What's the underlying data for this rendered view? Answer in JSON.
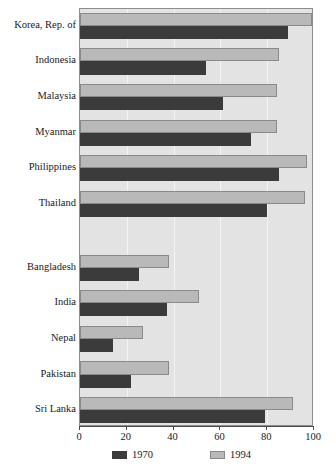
{
  "chart_data": {
    "type": "bar",
    "orientation": "horizontal",
    "title": "",
    "xlabel": "",
    "ylabel": "",
    "xlim": [
      0,
      100
    ],
    "xticks": [
      0,
      20,
      40,
      60,
      80,
      100
    ],
    "xtick_labels": [
      "0",
      "20",
      "40",
      "60",
      "80",
      "100"
    ],
    "grid": true,
    "legend_position": "bottom",
    "categories": [
      "Korea, Rep. of",
      "Indonesia",
      "Malaysia",
      "Myanmar",
      "Philippines",
      "Thailand",
      "Bangladesh",
      "India",
      "Nepal",
      "Pakistan",
      "Sri Lanka"
    ],
    "group_breaks": [
      6
    ],
    "series": [
      {
        "name": "1970",
        "color": "#3b3b3b",
        "values": [
          89,
          54,
          61,
          73,
          85,
          80,
          25,
          37,
          14,
          22,
          79
        ]
      },
      {
        "name": "1994",
        "color": "#b9b9b9",
        "values": [
          99,
          85,
          84,
          84,
          97,
          96,
          38,
          51,
          27,
          38,
          91
        ]
      }
    ]
  },
  "legend": {
    "entries": [
      {
        "label": "1970",
        "swatch": "s1970"
      },
      {
        "label": "1994",
        "swatch": "s1994"
      }
    ]
  },
  "colors": {
    "series_1970": "#3b3b3b",
    "series_1994": "#b9b9b9",
    "plot_background": "#e3e3e3",
    "gridline": "#f4f4f4",
    "axis": "#4a4a4a",
    "text": "#1a1a1a"
  }
}
